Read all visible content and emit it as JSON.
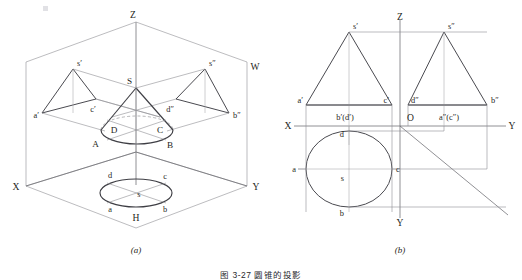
{
  "figure": {
    "caption": "图 3-27  圆锥的投影",
    "panels": [
      {
        "key": "a",
        "label": "(a)",
        "title": "pictorial-projection-of-cone"
      },
      {
        "key": "b",
        "label": "(b)",
        "title": "three-view-projection-of-cone"
      }
    ]
  },
  "panel_a": {
    "label": "(a)",
    "axes": [
      {
        "name": "Z",
        "text": "Z"
      },
      {
        "name": "X",
        "text": "X"
      },
      {
        "name": "Y",
        "text": "Y"
      },
      {
        "name": "W",
        "text": "W"
      },
      {
        "name": "H",
        "text": "H"
      }
    ],
    "points": [
      {
        "name": "apex-3d",
        "text": "S"
      },
      {
        "name": "base-front-left",
        "text": "A"
      },
      {
        "name": "base-front-right",
        "text": "B"
      },
      {
        "name": "base-right",
        "text": "C"
      },
      {
        "name": "base-left",
        "text": "D"
      },
      {
        "name": "v-apex",
        "text": "s′"
      },
      {
        "name": "v-left",
        "text": "a′"
      },
      {
        "name": "v-right",
        "text": "c′"
      },
      {
        "name": "w-apex",
        "text": "s″"
      },
      {
        "name": "w-left",
        "text": "d″"
      },
      {
        "name": "w-right",
        "text": "b″"
      },
      {
        "name": "h-apex",
        "text": "s"
      },
      {
        "name": "h-top",
        "text": "d"
      },
      {
        "name": "h-right-upper",
        "text": "c"
      },
      {
        "name": "h-left",
        "text": "a"
      },
      {
        "name": "h-bottom",
        "text": "b"
      }
    ]
  },
  "panel_b": {
    "label": "(b)",
    "axes": [
      {
        "name": "Z",
        "text": "Z"
      },
      {
        "name": "X",
        "text": "X"
      },
      {
        "name": "Y-right",
        "text": "Y"
      },
      {
        "name": "Y-bottom",
        "text": "Y"
      },
      {
        "name": "origin",
        "text": "O"
      }
    ],
    "points": [
      {
        "name": "front-apex",
        "text": "s′"
      },
      {
        "name": "front-left",
        "text": "a′"
      },
      {
        "name": "front-right",
        "text": "c′"
      },
      {
        "name": "front-center",
        "text": "b′(d′)"
      },
      {
        "name": "side-apex",
        "text": "s″"
      },
      {
        "name": "side-left",
        "text": "d″"
      },
      {
        "name": "side-right",
        "text": "b″"
      },
      {
        "name": "side-center",
        "text": "a″(c″)"
      },
      {
        "name": "top-d",
        "text": "d"
      },
      {
        "name": "top-a",
        "text": "a"
      },
      {
        "name": "top-c",
        "text": "c"
      },
      {
        "name": "top-b",
        "text": "b"
      },
      {
        "name": "top-s",
        "text": "s"
      }
    ]
  },
  "colors": {
    "background": "#ffffff",
    "thin_line": "#8f8f93",
    "medium_line": "#636367",
    "heavy_line": "#3e3e44",
    "axis_line": "#6c6c72",
    "text": "#1f1f22"
  }
}
